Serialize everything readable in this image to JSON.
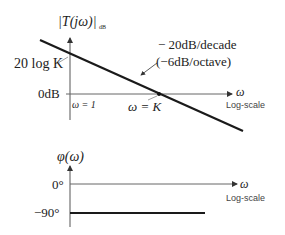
{
  "magnitude_plot": {
    "ylabel": "|T(jω)|",
    "ylabel_subscript": "dB",
    "xlabel": "ω",
    "x_scale_label": "Log-scale",
    "y_tick_top": "20 log K",
    "y_tick_zero": "0dB",
    "x_marker_origin": "ω = 1",
    "x_marker_crossing": "ω = K",
    "slope_annotation_line1": "− 20dB/decade",
    "slope_annotation_line2": "(−6dB/octave)"
  },
  "phase_plot": {
    "ylabel": "φ(ω)",
    "xlabel": "ω",
    "x_scale_label": "Log-scale",
    "y_tick_zero": "0°",
    "y_tick_minus90": "−90°"
  },
  "colors": {
    "curve": "#1a1a1a",
    "axis": "#555555",
    "text": "#222222"
  }
}
